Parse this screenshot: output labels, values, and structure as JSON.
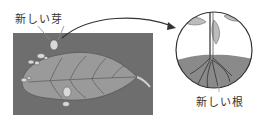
{
  "diagram": {
    "labels": {
      "new_bud": "新しい芽",
      "new_root": "新しい根"
    },
    "colors": {
      "soil": "#6e6e6e",
      "leaf": "#9a9a9a",
      "vein": "#5a5a5a",
      "bud": "#d8d8d8",
      "inset_soil": "#8a8a8a",
      "line": "#333333"
    }
  }
}
